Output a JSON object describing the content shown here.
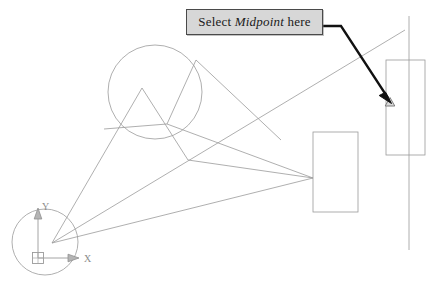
{
  "page": {
    "width": 437,
    "height": 292,
    "background": "#ffffff"
  },
  "callout": {
    "prefix_label": "Select ",
    "emphasis_label": "Midpoint",
    "suffix_label": " here",
    "full_text": "Select Midpoint here",
    "fill_color": "#d7d7d7",
    "border_color": "#4a4a4a",
    "text_color": "#1a1a1a"
  },
  "leader": {
    "name": "leader-arrow",
    "color": "#111111",
    "start_x": 323,
    "start_y": 26,
    "elbow_x": 341,
    "elbow_y": 26,
    "tip_x": 390,
    "tip_y": 101
  },
  "ucs_icon": {
    "x_axis_label": "X",
    "y_axis_label": "Y",
    "origin_x": 38,
    "origin_y": 258,
    "color": "#9a9a9a"
  },
  "snap_marker": {
    "name": "midpoint-snap-marker",
    "type": "triangle",
    "x": 390,
    "y": 102,
    "color": "#8a8a8a"
  },
  "geometry": {
    "line_color": "#9a9a9a",
    "circles": [
      {
        "name": "upper-circle",
        "cx": 155,
        "cy": 92,
        "r": 47
      },
      {
        "name": "lower-left-circle",
        "cx": 45,
        "cy": 242,
        "r": 33
      }
    ],
    "rectangles": [
      {
        "name": "middle-rectangle",
        "x": 313,
        "y": 132,
        "w": 45,
        "h": 80
      },
      {
        "name": "right-rectangle",
        "x": 386,
        "y": 60,
        "w": 39,
        "h": 95
      }
    ],
    "vertical_line": {
      "name": "right-vertical-line",
      "x": 409,
      "y1": 16,
      "y2": 250
    },
    "lines": [
      {
        "name": "edge-apex-to-lower-left",
        "x1": 142,
        "y1": 88,
        "x2": 52,
        "y2": 243
      },
      {
        "name": "edge-apex-to-node",
        "x1": 142,
        "y1": 88,
        "x2": 188,
        "y2": 160
      },
      {
        "name": "edge-node-to-rect",
        "x1": 188,
        "y1": 160,
        "x2": 313,
        "y2": 178
      },
      {
        "name": "edge-lower-left-to-rect",
        "x1": 52,
        "y1": 243,
        "x2": 313,
        "y2": 178
      },
      {
        "name": "edge-upper-to-rect",
        "x1": 167,
        "y1": 124,
        "x2": 313,
        "y2": 178
      },
      {
        "name": "edge-circle-top-to-node",
        "x1": 196,
        "y1": 60,
        "x2": 167,
        "y2": 124
      },
      {
        "name": "edge-circle-top-to-rect",
        "x1": 196,
        "y1": 60,
        "x2": 281,
        "y2": 140
      },
      {
        "name": "edge-left-to-node",
        "x1": 104,
        "y1": 129,
        "x2": 167,
        "y2": 124
      },
      {
        "name": "long-diagonal",
        "x1": 52,
        "y1": 243,
        "x2": 405,
        "y2": 30
      }
    ]
  }
}
